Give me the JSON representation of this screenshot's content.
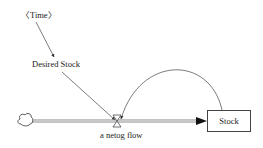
{
  "diagram": {
    "type": "stock-and-flow",
    "nodes": {
      "time": {
        "label": "〈Time〉"
      },
      "desired_stock": {
        "label": "Desired Stock"
      },
      "flow": {
        "label": "a netog flow"
      },
      "stock": {
        "label": "Stock"
      },
      "source": {
        "label": ""
      }
    },
    "edges": [
      {
        "from": "time",
        "to": "desired_stock"
      },
      {
        "from": "desired_stock",
        "to": "flow"
      },
      {
        "from": "stock",
        "to": "flow",
        "shape": "arc"
      },
      {
        "from": "source",
        "to": "stock",
        "type": "flow-pipe"
      }
    ],
    "colors": {
      "line": "#444444",
      "pipe": "#bbbbbb",
      "text": "#222222"
    }
  }
}
